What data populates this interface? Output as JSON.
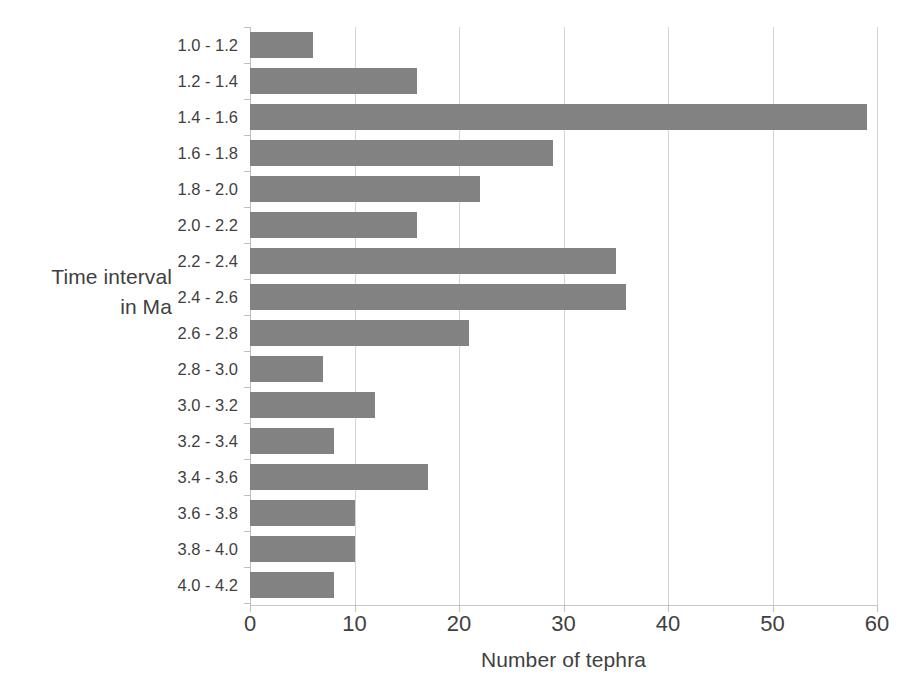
{
  "chart_data": {
    "type": "bar",
    "orientation": "horizontal",
    "title": "",
    "xlabel": "Number of tephra",
    "ylabel": "Time interval\nin Ma",
    "categories": [
      "1.0 - 1.2",
      "1.2 - 1.4",
      "1.4 - 1.6",
      "1.6 - 1.8",
      "1.8 - 2.0",
      "2.0 - 2.2",
      "2.2 - 2.4",
      "2.4 - 2.6",
      "2.6 - 2.8",
      "2.8 - 3.0",
      "3.0 - 3.2",
      "3.2 - 3.4",
      "3.4 - 3.6",
      "3.6 - 3.8",
      "3.8 - 4.0",
      "4.0 - 4.2"
    ],
    "values": [
      6,
      16,
      59,
      29,
      22,
      16,
      35,
      36,
      21,
      7,
      12,
      8,
      17,
      10,
      10,
      8
    ],
    "xlim": [
      0,
      60
    ],
    "xticks": [
      0,
      10,
      20,
      30,
      40,
      50,
      60
    ],
    "xtick_labels": [
      "0",
      "10",
      "20",
      "30",
      "40",
      "50",
      "60"
    ],
    "grid": "vertical",
    "legend": false,
    "bar_color": "#828282",
    "gridline_color": "#d4d4d4",
    "axis_color": "#bfbfbf",
    "text_color": "#3f3f3f",
    "background_color": "#ffffff"
  }
}
